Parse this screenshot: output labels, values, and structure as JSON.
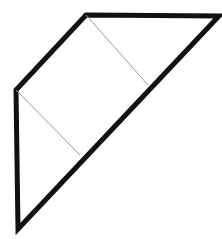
{
  "canvas": {
    "width": 222,
    "height": 239,
    "background": "#ffffff",
    "title": "Folded paper diagram"
  },
  "style": {
    "outline_color": "#111111",
    "outline_width": 5,
    "fold_color": "#9a9a9a",
    "fold_width": 1,
    "fill_color": "#ffffff"
  },
  "chart_data": {
    "type": "diagram",
    "xlabel": "",
    "ylabel": "",
    "xlim": [
      0,
      222
    ],
    "ylim": [
      0,
      239
    ],
    "grid": false,
    "legend": "none",
    "vertices": {
      "apex_top_left": [
        86,
        15
      ],
      "corner_top_right": [
        219,
        16
      ],
      "corner_bottom_left": [
        18,
        229
      ],
      "corner_mid_left": [
        16,
        90
      ],
      "fold_end_upper": [
        148,
        85
      ],
      "fold_end_lower": [
        80,
        155
      ]
    },
    "series": [
      {
        "name": "outline",
        "kind": "polygon",
        "closed": true,
        "stroke": "#111111",
        "stroke_width": 5,
        "fill": "#ffffff",
        "points": [
          [
            86,
            15
          ],
          [
            219,
            16
          ],
          [
            18,
            229
          ],
          [
            16,
            90
          ]
        ]
      },
      {
        "name": "fold-line-upper",
        "kind": "line",
        "closed": false,
        "stroke": "#9a9a9a",
        "stroke_width": 1,
        "fill": "none",
        "points": [
          [
            86,
            15
          ],
          [
            148,
            85
          ]
        ]
      },
      {
        "name": "fold-line-lower",
        "kind": "line",
        "closed": false,
        "stroke": "#9a9a9a",
        "stroke_width": 1,
        "fill": "none",
        "points": [
          [
            16,
            90
          ],
          [
            80,
            155
          ]
        ]
      }
    ],
    "annotations": []
  }
}
